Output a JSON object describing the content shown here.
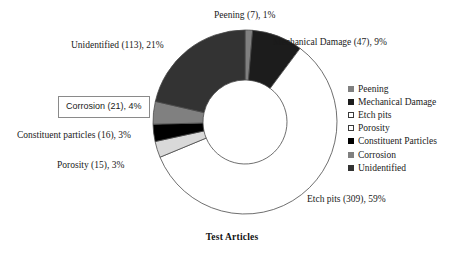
{
  "chart_data": {
    "type": "pie",
    "title": "Test Articles",
    "xlabel": "",
    "ylabel": "",
    "donut": true,
    "legend_position": "right",
    "grid": false,
    "total": 528,
    "categories": [
      "Peening",
      "Mechanical Damage",
      "Etch pits",
      "Porosity",
      "Constituent Particles",
      "Corrosion",
      "Unidentified"
    ],
    "values": [
      7,
      47,
      309,
      15,
      16,
      21,
      113
    ],
    "percentages": [
      1,
      9,
      59,
      3,
      3,
      4,
      21
    ],
    "colors": [
      "#808080",
      "#1c1c1c",
      "#ffffff",
      "#d9d9d9",
      "#000000",
      "#808080",
      "#333333"
    ],
    "slice_order_clockwise_from_top": [
      "Peening",
      "Mechanical Damage",
      "Etch pits",
      "Porosity",
      "Constituent Particles",
      "Corrosion",
      "Unidentified"
    ]
  },
  "callouts": [
    {
      "text": "Peening (7), 1%",
      "boxed": false
    },
    {
      "text": "Mechanical Damage (47), 9%",
      "boxed": false
    },
    {
      "text": "Unidentified (113), 21%",
      "boxed": false
    },
    {
      "text": "Corrosion (21), 4%",
      "boxed": true
    },
    {
      "text": "Constituent particles (16), 3%",
      "boxed": false
    },
    {
      "text": "Porosity (15), 3%",
      "boxed": false
    },
    {
      "text": "Etch pits (309), 59%",
      "boxed": false
    }
  ],
  "legend": {
    "items": [
      {
        "label": "Peening",
        "color": "#808080",
        "outlined": false
      },
      {
        "label": "Mechanical Damage",
        "color": "#1c1c1c",
        "outlined": false
      },
      {
        "label": "Etch pits",
        "color": "#ffffff",
        "outlined": true
      },
      {
        "label": "Porosity",
        "color": "#ffffff",
        "outlined": true
      },
      {
        "label": "Constituent Particles",
        "color": "#000000",
        "outlined": false
      },
      {
        "label": "Corrosion",
        "color": "#808080",
        "outlined": false
      },
      {
        "label": "Unidentified",
        "color": "#333333",
        "outlined": false
      }
    ]
  },
  "title": {
    "text": "Test Articles"
  }
}
